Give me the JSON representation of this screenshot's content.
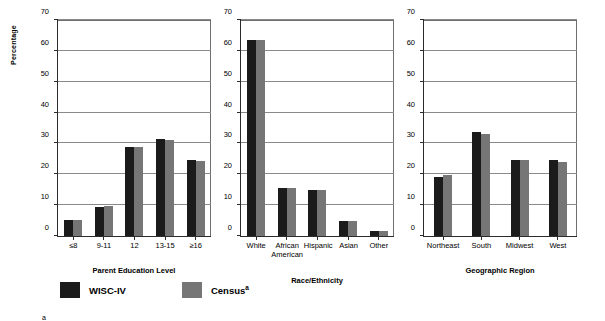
{
  "chart_data": {
    "type": "bar",
    "title": "",
    "ylabel": "Percentage",
    "ylim": [
      0,
      70
    ],
    "yticks": [
      0,
      10,
      20,
      30,
      40,
      50,
      60,
      70
    ],
    "grid": true,
    "legend_position": "bottom",
    "series_names": [
      "WISC-IV",
      "Census"
    ],
    "panels": [
      {
        "xlabel": "Parent Education Level",
        "categories": [
          "≤8",
          "9-11",
          "12",
          "13-15",
          "≥16"
        ],
        "series": [
          {
            "name": "WISC-IV",
            "values": [
              5.2,
              9.4,
              28.7,
              31.3,
              24.4
            ]
          },
          {
            "name": "Census",
            "values": [
              5.2,
              9.7,
              28.7,
              30.9,
              24.3
            ]
          }
        ]
      },
      {
        "xlabel": "Race/Ethnicity",
        "categories": [
          "White",
          "African\nAmerican",
          "Hispanic",
          "Asian",
          "Other"
        ],
        "series": [
          {
            "name": "WISC-IV",
            "values": [
              63.1,
              15.5,
              15.0,
              4.9,
              1.6
            ]
          },
          {
            "name": "Census",
            "values": [
              63.2,
              15.4,
              15.0,
              4.9,
              1.6
            ]
          }
        ]
      },
      {
        "xlabel": "Geographic Region",
        "categories": [
          "Northeast",
          "South",
          "Midwest",
          "West"
        ],
        "series": [
          {
            "name": "WISC-IV",
            "values": [
              19.1,
              33.5,
              24.5,
              24.5
            ]
          },
          {
            "name": "Census",
            "values": [
              19.8,
              33.0,
              24.4,
              24.0
            ]
          }
        ]
      }
    ],
    "colors": {
      "wisc_iv": "#1b1b1b",
      "census": "#767676",
      "axis": "#2b2b2b",
      "grid": "#8a8a8a"
    }
  },
  "legend": {
    "items": [
      {
        "label": "WISC-IV",
        "superscript": "",
        "swatch": "dark"
      },
      {
        "label": "Census",
        "superscript": "a",
        "swatch": "gray"
      }
    ]
  },
  "footnote": {
    "marker": "a"
  }
}
